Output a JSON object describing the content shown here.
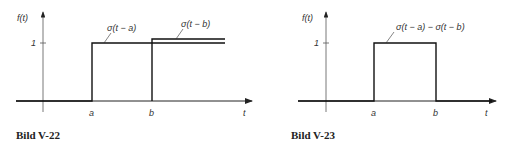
{
  "figures": [
    {
      "caption": "Bild V-22",
      "y_axis_label": "f(t)",
      "x_axis_label": "t",
      "y_tick": "1",
      "x_ticks": [
        "a",
        "b"
      ],
      "curves": [
        {
          "label": "σ(t − a)",
          "description": "unit step starting at t = a"
        },
        {
          "label": "σ(t − b)",
          "description": "unit step starting at t = b"
        }
      ]
    },
    {
      "caption": "Bild V-23",
      "y_axis_label": "f(t)",
      "x_axis_label": "t",
      "y_tick": "1",
      "x_ticks": [
        "a",
        "b"
      ],
      "curves": [
        {
          "label": "σ(t − a) − σ(t − b)",
          "description": "rectangular pulse from a to b"
        }
      ]
    }
  ],
  "colors": {
    "line": "#111111",
    "axis": "#222222",
    "text": "#333333"
  }
}
